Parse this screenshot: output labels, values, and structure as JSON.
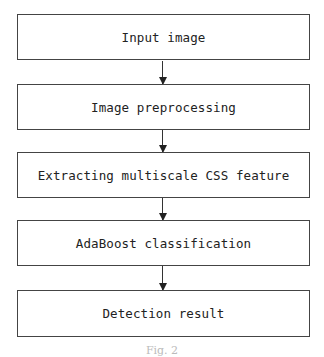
{
  "diagram": {
    "type": "flowchart",
    "direction": "top-to-bottom",
    "steps": [
      {
        "label": "Input image"
      },
      {
        "label": "Image preprocessing"
      },
      {
        "label": "Extracting multiscale CSS feature"
      },
      {
        "label": "AdaBoost classification"
      },
      {
        "label": "Detection result"
      }
    ],
    "edges": [
      {
        "from": 0,
        "to": 1
      },
      {
        "from": 1,
        "to": 2
      },
      {
        "from": 2,
        "to": 3
      },
      {
        "from": 3,
        "to": 4
      }
    ],
    "caption": "Fig. 2"
  }
}
